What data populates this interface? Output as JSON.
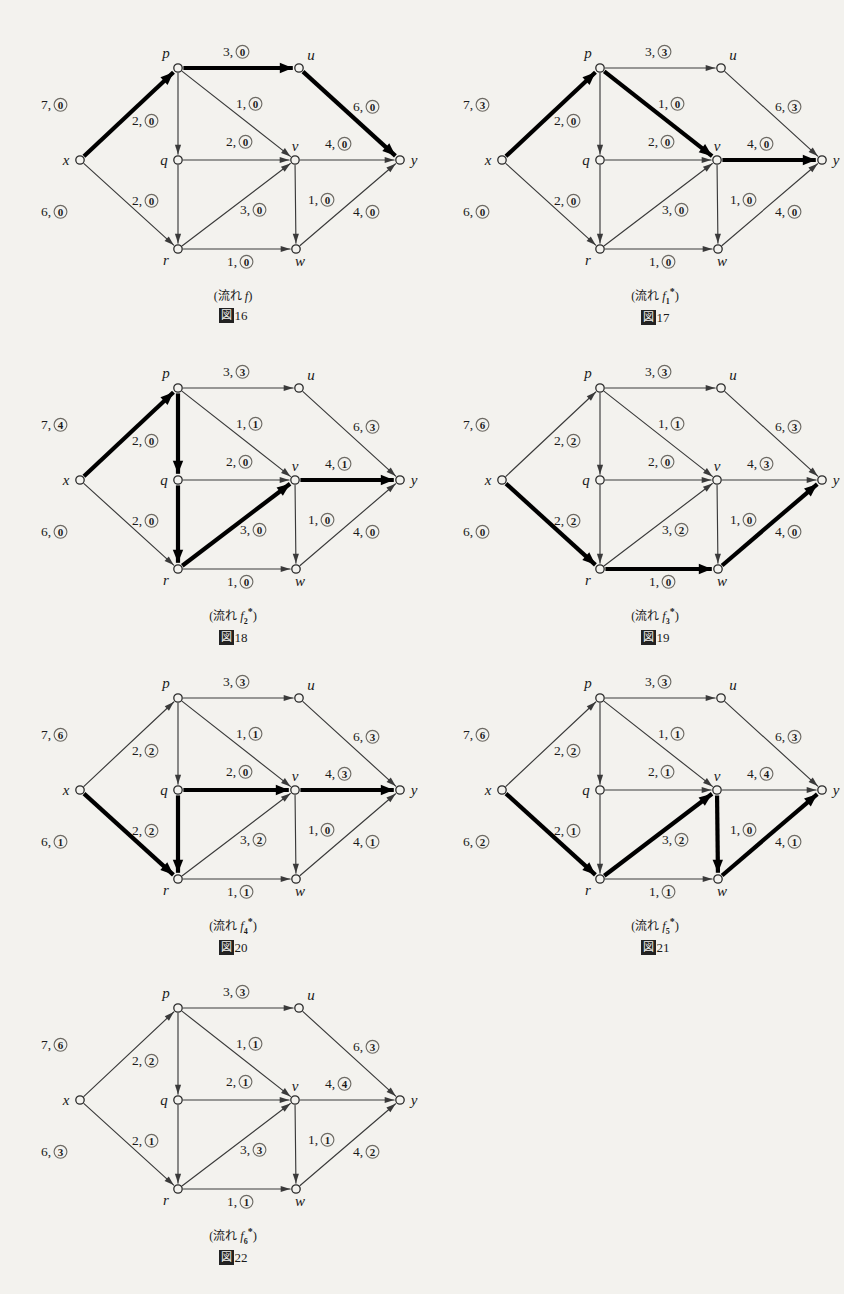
{
  "running_head": "",
  "graph": {
    "nodes": [
      {
        "id": "x",
        "label": "x",
        "x": 62,
        "y": 142,
        "label_dx": -14,
        "label_dy": 5
      },
      {
        "id": "p",
        "label": "p",
        "x": 160,
        "y": 50,
        "label_dx": -12,
        "label_dy": -10
      },
      {
        "id": "q",
        "label": "q",
        "x": 160,
        "y": 142,
        "label_dx": -14,
        "label_dy": 5
      },
      {
        "id": "r",
        "label": "r",
        "x": 160,
        "y": 231,
        "label_dx": -12,
        "label_dy": 16
      },
      {
        "id": "u",
        "label": "u",
        "x": 281,
        "y": 50,
        "label_dx": 12,
        "label_dy": -8
      },
      {
        "id": "v",
        "label": "v",
        "x": 277,
        "y": 142,
        "label_dx": 0,
        "label_dy": -9
      },
      {
        "id": "w",
        "label": "w",
        "x": 278,
        "y": 231,
        "label_dx": 4,
        "label_dy": 17
      },
      {
        "id": "y",
        "label": "y",
        "x": 382,
        "y": 142,
        "label_dx": 14,
        "label_dy": 5
      }
    ],
    "edges": [
      {
        "id": "xp",
        "from": "x",
        "to": "p",
        "lx": 33,
        "ly": 91
      },
      {
        "id": "xr",
        "from": "x",
        "to": "r",
        "lx": 33,
        "ly": 198
      },
      {
        "id": "pu",
        "from": "p",
        "to": "u",
        "lx": 215,
        "ly": 38
      },
      {
        "id": "pq",
        "from": "p",
        "to": "q",
        "lx": 124,
        "ly": 107
      },
      {
        "id": "pv",
        "from": "p",
        "to": "v",
        "lx": 228,
        "ly": 90
      },
      {
        "id": "qr",
        "from": "q",
        "to": "r",
        "lx": 124,
        "ly": 187
      },
      {
        "id": "qv",
        "from": "q",
        "to": "v",
        "lx": 218,
        "ly": 128
      },
      {
        "id": "rv",
        "from": "r",
        "to": "v",
        "lx": 232,
        "ly": 196
      },
      {
        "id": "rw",
        "from": "r",
        "to": "w",
        "lx": 219,
        "ly": 248
      },
      {
        "id": "uy",
        "from": "u",
        "to": "y",
        "lx": 345,
        "ly": 93
      },
      {
        "id": "vy",
        "from": "v",
        "to": "y",
        "lx": 317,
        "ly": 130
      },
      {
        "id": "vw",
        "from": "v",
        "to": "w",
        "lx": 300,
        "ly": 186
      },
      {
        "id": "wy",
        "from": "w",
        "to": "y",
        "lx": 345,
        "ly": 198
      }
    ]
  },
  "figures": [
    {
      "key": "fig16",
      "left": 18,
      "top": 18,
      "caption_flow_prefix": "(流れ ",
      "caption_flow_symbol": "f",
      "caption_sub": "",
      "caption_star": "",
      "caption_flow_suffix": ")",
      "caption_number_prefix": "図",
      "caption_number": "16",
      "labels": {
        "xp": {
          "cap": "7",
          "flow": "0"
        },
        "xr": {
          "cap": "6",
          "flow": "0"
        },
        "pu": {
          "cap": "3",
          "flow": "0"
        },
        "pq": {
          "cap": "2",
          "flow": "0"
        },
        "pv": {
          "cap": "1",
          "flow": "0"
        },
        "qr": {
          "cap": "2",
          "flow": "0"
        },
        "qv": {
          "cap": "2",
          "flow": "0"
        },
        "rv": {
          "cap": "3",
          "flow": "0"
        },
        "rw": {
          "cap": "1",
          "flow": "0"
        },
        "uy": {
          "cap": "6",
          "flow": "0"
        },
        "vy": {
          "cap": "4",
          "flow": "0"
        },
        "vw": {
          "cap": "1",
          "flow": "0"
        },
        "wy": {
          "cap": "4",
          "flow": "0"
        }
      },
      "highlighted": [
        "xp",
        "pu",
        "uy"
      ]
    },
    {
      "key": "fig17",
      "left": 440,
      "top": 18,
      "caption_flow_prefix": "(流れ ",
      "caption_flow_symbol": "f",
      "caption_sub": "1",
      "caption_star": "*",
      "caption_flow_suffix": ")",
      "caption_number_prefix": "図",
      "caption_number": "17",
      "labels": {
        "xp": {
          "cap": "7",
          "flow": "3"
        },
        "xr": {
          "cap": "6",
          "flow": "0"
        },
        "pu": {
          "cap": "3",
          "flow": "3"
        },
        "pq": {
          "cap": "2",
          "flow": "0"
        },
        "pv": {
          "cap": "1",
          "flow": "0"
        },
        "qr": {
          "cap": "2",
          "flow": "0"
        },
        "qv": {
          "cap": "2",
          "flow": "0"
        },
        "rv": {
          "cap": "3",
          "flow": "0"
        },
        "rw": {
          "cap": "1",
          "flow": "0"
        },
        "uy": {
          "cap": "6",
          "flow": "3"
        },
        "vy": {
          "cap": "4",
          "flow": "0"
        },
        "vw": {
          "cap": "1",
          "flow": "0"
        },
        "wy": {
          "cap": "4",
          "flow": "0"
        }
      },
      "highlighted": [
        "xp",
        "pv",
        "vy"
      ]
    },
    {
      "key": "fig18",
      "left": 18,
      "top": 338,
      "caption_flow_prefix": "(流れ ",
      "caption_flow_symbol": "f",
      "caption_sub": "2",
      "caption_star": "*",
      "caption_flow_suffix": ")",
      "caption_number_prefix": "図",
      "caption_number": "18",
      "labels": {
        "xp": {
          "cap": "7",
          "flow": "4"
        },
        "xr": {
          "cap": "6",
          "flow": "0"
        },
        "pu": {
          "cap": "3",
          "flow": "3"
        },
        "pq": {
          "cap": "2",
          "flow": "0"
        },
        "pv": {
          "cap": "1",
          "flow": "1"
        },
        "qr": {
          "cap": "2",
          "flow": "0"
        },
        "qv": {
          "cap": "2",
          "flow": "0"
        },
        "rv": {
          "cap": "3",
          "flow": "0"
        },
        "rw": {
          "cap": "1",
          "flow": "0"
        },
        "uy": {
          "cap": "6",
          "flow": "3"
        },
        "vy": {
          "cap": "4",
          "flow": "1"
        },
        "vw": {
          "cap": "1",
          "flow": "0"
        },
        "wy": {
          "cap": "4",
          "flow": "0"
        }
      },
      "highlighted": [
        "xp",
        "pq",
        "qr",
        "rv",
        "vy"
      ]
    },
    {
      "key": "fig19",
      "left": 440,
      "top": 338,
      "caption_flow_prefix": "(流れ ",
      "caption_flow_symbol": "f",
      "caption_sub": "3",
      "caption_star": "*",
      "caption_flow_suffix": ")",
      "caption_number_prefix": "図",
      "caption_number": "19",
      "labels": {
        "xp": {
          "cap": "7",
          "flow": "6"
        },
        "xr": {
          "cap": "6",
          "flow": "0"
        },
        "pu": {
          "cap": "3",
          "flow": "3"
        },
        "pq": {
          "cap": "2",
          "flow": "2"
        },
        "pv": {
          "cap": "1",
          "flow": "1"
        },
        "qr": {
          "cap": "2",
          "flow": "2"
        },
        "qv": {
          "cap": "2",
          "flow": "0"
        },
        "rv": {
          "cap": "3",
          "flow": "2"
        },
        "rw": {
          "cap": "1",
          "flow": "0"
        },
        "uy": {
          "cap": "6",
          "flow": "3"
        },
        "vy": {
          "cap": "4",
          "flow": "3"
        },
        "vw": {
          "cap": "1",
          "flow": "0"
        },
        "wy": {
          "cap": "4",
          "flow": "0"
        }
      },
      "highlighted": [
        "xr",
        "rw",
        "wy"
      ]
    },
    {
      "key": "fig20",
      "left": 18,
      "top": 648,
      "caption_flow_prefix": "(流れ ",
      "caption_flow_symbol": "f",
      "caption_sub": "4",
      "caption_star": "*",
      "caption_flow_suffix": ")",
      "caption_number_prefix": "図",
      "caption_number": "20",
      "labels": {
        "xp": {
          "cap": "7",
          "flow": "6"
        },
        "xr": {
          "cap": "6",
          "flow": "1"
        },
        "pu": {
          "cap": "3",
          "flow": "3"
        },
        "pq": {
          "cap": "2",
          "flow": "2"
        },
        "pv": {
          "cap": "1",
          "flow": "1"
        },
        "qr": {
          "cap": "2",
          "flow": "2"
        },
        "qv": {
          "cap": "2",
          "flow": "0"
        },
        "rv": {
          "cap": "3",
          "flow": "2"
        },
        "rw": {
          "cap": "1",
          "flow": "1"
        },
        "uy": {
          "cap": "6",
          "flow": "3"
        },
        "vy": {
          "cap": "4",
          "flow": "3"
        },
        "vw": {
          "cap": "1",
          "flow": "0"
        },
        "wy": {
          "cap": "4",
          "flow": "1"
        }
      },
      "highlighted": [
        "xr",
        "qr",
        "qv",
        "vy"
      ]
    },
    {
      "key": "fig21",
      "left": 440,
      "top": 648,
      "caption_flow_prefix": "(流れ ",
      "caption_flow_symbol": "f",
      "caption_sub": "5",
      "caption_star": "*",
      "caption_flow_suffix": ")",
      "caption_number_prefix": "図",
      "caption_number": "21",
      "labels": {
        "xp": {
          "cap": "7",
          "flow": "6"
        },
        "xr": {
          "cap": "6",
          "flow": "2"
        },
        "pu": {
          "cap": "3",
          "flow": "3"
        },
        "pq": {
          "cap": "2",
          "flow": "2"
        },
        "pv": {
          "cap": "1",
          "flow": "1"
        },
        "qr": {
          "cap": "2",
          "flow": "1"
        },
        "qv": {
          "cap": "2",
          "flow": "1"
        },
        "rv": {
          "cap": "3",
          "flow": "2"
        },
        "rw": {
          "cap": "1",
          "flow": "1"
        },
        "uy": {
          "cap": "6",
          "flow": "3"
        },
        "vy": {
          "cap": "4",
          "flow": "4"
        },
        "vw": {
          "cap": "1",
          "flow": "0"
        },
        "wy": {
          "cap": "4",
          "flow": "1"
        }
      },
      "highlighted": [
        "xr",
        "rv",
        "vw",
        "wy"
      ]
    },
    {
      "key": "fig22",
      "left": 18,
      "top": 958,
      "caption_flow_prefix": "(流れ ",
      "caption_flow_symbol": "f",
      "caption_sub": "6",
      "caption_star": "*",
      "caption_flow_suffix": ")",
      "caption_number_prefix": "図",
      "caption_number": "22",
      "labels": {
        "xp": {
          "cap": "7",
          "flow": "6"
        },
        "xr": {
          "cap": "6",
          "flow": "3"
        },
        "pu": {
          "cap": "3",
          "flow": "3"
        },
        "pq": {
          "cap": "2",
          "flow": "2"
        },
        "pv": {
          "cap": "1",
          "flow": "1"
        },
        "qr": {
          "cap": "2",
          "flow": "1"
        },
        "qv": {
          "cap": "2",
          "flow": "1"
        },
        "rv": {
          "cap": "3",
          "flow": "3"
        },
        "rw": {
          "cap": "1",
          "flow": "1"
        },
        "uy": {
          "cap": "6",
          "flow": "3"
        },
        "vy": {
          "cap": "4",
          "flow": "4"
        },
        "vw": {
          "cap": "1",
          "flow": "1"
        },
        "wy": {
          "cap": "4",
          "flow": "2"
        }
      },
      "highlighted": []
    }
  ],
  "colors": {
    "ink": "#1a1a1a",
    "paper": "#f3f2ee",
    "thin_edge": "#3a3a3a",
    "bold_edge": "#000000"
  }
}
